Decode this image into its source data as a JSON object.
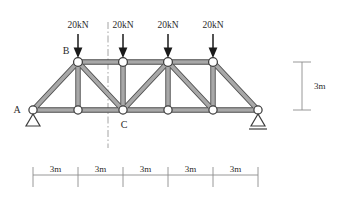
{
  "figure": {
    "type": "statically-determinate-planar-truss",
    "span_total": "15m",
    "height": "3m"
  },
  "loads": [
    {
      "label": "20kN",
      "magnitude": 20,
      "unit": "kN",
      "direction": "down",
      "at_node": "T1"
    },
    {
      "label": "20kN",
      "magnitude": 20,
      "unit": "kN",
      "direction": "down",
      "at_node": "T2"
    },
    {
      "label": "20kN",
      "magnitude": 20,
      "unit": "kN",
      "direction": "down",
      "at_node": "T3"
    },
    {
      "label": "20kN",
      "magnitude": 20,
      "unit": "kN",
      "direction": "down",
      "at_node": "T4"
    }
  ],
  "node_labels": {
    "a": "A",
    "b": "B",
    "c": "C"
  },
  "supports": {
    "left": {
      "type": "pin",
      "at_node": "A"
    },
    "right": {
      "type": "roller",
      "at_node": "B6"
    }
  },
  "dimensions": {
    "horizontal": [
      {
        "label": "3m"
      },
      {
        "label": "3m"
      },
      {
        "label": "3m"
      },
      {
        "label": "3m"
      },
      {
        "label": "3m"
      }
    ],
    "vertical": {
      "label": "3m"
    }
  },
  "section_cut": {
    "present": true,
    "style": "dash-dot"
  },
  "colors": {
    "member_outline": "#4a4a4a",
    "member_fill": "#a8a8a8",
    "joint_fill": "#ffffff",
    "text": "#2b2b2b",
    "dimension": "#8c8c8c",
    "background": "#ffffff"
  },
  "geometry": {
    "bottom_nodes_x": [
      33,
      78,
      123,
      168,
      213,
      258
    ],
    "bottom_y": 110,
    "top_nodes_x": [
      78,
      123,
      168,
      213
    ],
    "top_y": 62
  }
}
